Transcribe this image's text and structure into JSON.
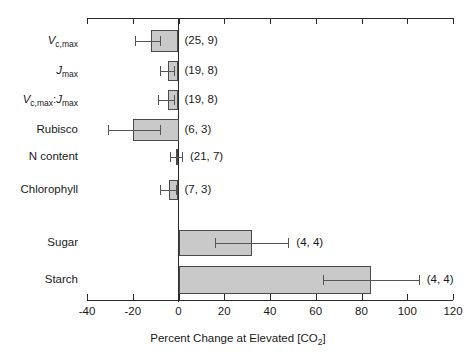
{
  "chart_data": {
    "type": "bar",
    "orientation": "horizontal",
    "title": "",
    "subtitle": "",
    "xlabel": "Percent Change at Elevated [CO2]",
    "xlabel_parts": {
      "before": "Percent Change at Elevated [CO",
      "sub": "2",
      "after": "]"
    },
    "ylabel": "",
    "xlim": [
      -40,
      120
    ],
    "xticks": [
      -40,
      -20,
      0,
      20,
      40,
      60,
      80,
      100,
      120
    ],
    "xticklabels": [
      "-40",
      "-20",
      "0",
      "20",
      "40",
      "60",
      "80",
      "100",
      "120"
    ],
    "grid": false,
    "legend": "none",
    "zero_reference_line": 0,
    "bar_fill_color": "#c9c9c9",
    "bar_edge_color": "#4a4a4a",
    "error_bar_color": "#555555",
    "axis_color": "#2b2b2b",
    "categories": [
      "Vc,max",
      "Jmax",
      "Vc,max:Jmax",
      "Rubisco",
      "N content",
      "Chlorophyll",
      "Sugar",
      "Starch"
    ],
    "category_label_parts": [
      {
        "italic": "V",
        "sub": "c,max",
        "tail": ""
      },
      {
        "italic": "J",
        "sub": "max",
        "tail": ""
      },
      {
        "italic": "V",
        "sub": "c,max",
        "tail": ":",
        "italic2": "J",
        "sub2": "max"
      },
      {
        "plain": "Rubisco"
      },
      {
        "plain": "N content"
      },
      {
        "plain": "Chlorophyll"
      },
      {
        "plain": "Sugar"
      },
      {
        "plain": "Starch"
      }
    ],
    "values": [
      -12,
      -4.5,
      -4.5,
      -20,
      -1,
      -4,
      32,
      84
    ],
    "err_low": [
      -19,
      -8,
      -9,
      -31,
      -3.5,
      -8,
      16,
      63
    ],
    "err_high": [
      -8,
      -2,
      -2,
      -8,
      1.5,
      -1,
      48,
      105
    ],
    "n_labels": [
      "(25, 9)",
      "(19, 8)",
      "(19, 8)",
      "(6, 3)",
      "(21, 7)",
      "(7, 3)",
      "(4, 4)",
      "(4, 4)"
    ],
    "group_gap_after_index": 5
  }
}
